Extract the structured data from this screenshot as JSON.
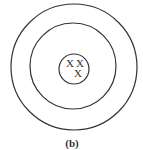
{
  "diagram": {
    "caption": "(b)",
    "circles": [
      {
        "name": "outer",
        "cx": 74,
        "cy": 67,
        "r": 63
      },
      {
        "name": "middle",
        "cx": 73,
        "cy": 66,
        "r": 43
      },
      {
        "name": "inner",
        "cx": 74,
        "cy": 69,
        "r": 15
      }
    ],
    "marks": [
      {
        "label": "X",
        "x": 70,
        "y": 66
      },
      {
        "label": "X",
        "x": 80,
        "y": 66
      },
      {
        "label": "X",
        "x": 78,
        "y": 77
      }
    ],
    "stroke_color": "#333333"
  }
}
